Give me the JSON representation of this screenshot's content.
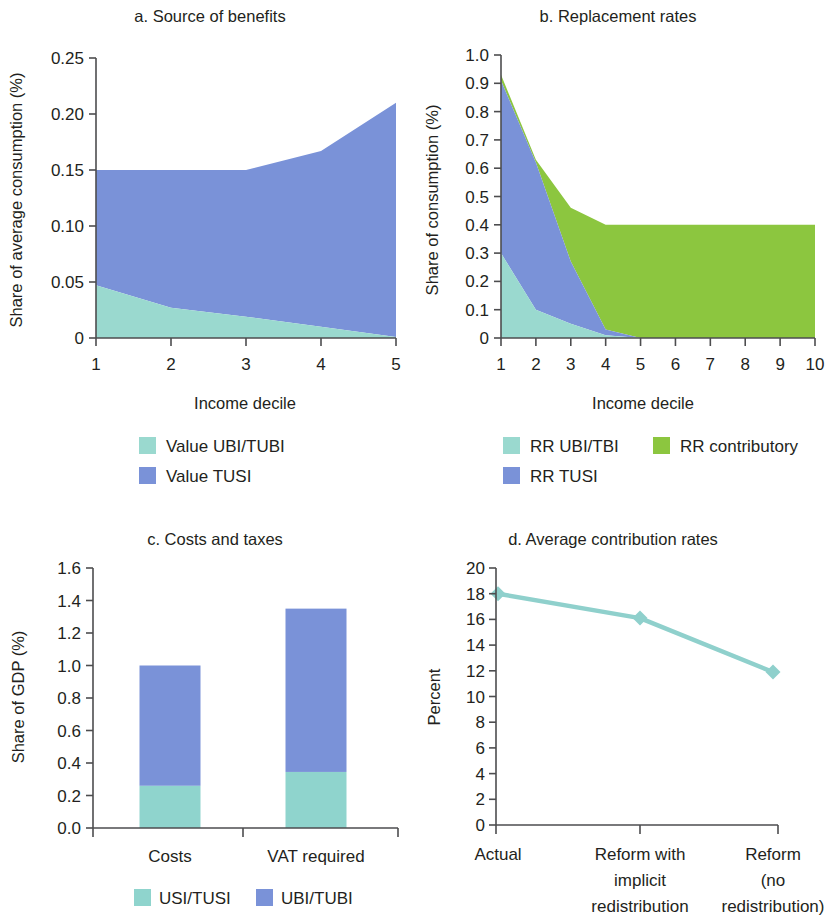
{
  "figure": {
    "background": "#ffffff",
    "axis_color": "#4d4d4f",
    "text_color": "#231f20"
  },
  "colors": {
    "teal_light": "#8fd4cd",
    "teal_area": "#7ec7a8",
    "teal_legend": "#9ad9cf",
    "blue": "#7a92d8",
    "green": "#8cc63f",
    "line_teal": "#8fd0cc"
  },
  "panels": {
    "a": {
      "title": "a. Source of benefits",
      "ylabel": "Share of average consumption (%)",
      "xlabel": "Income decile",
      "yticks": [
        "0",
        "0.05",
        "0.10",
        "0.15",
        "0.20",
        "0.25"
      ],
      "xticks": [
        "1",
        "2",
        "3",
        "4",
        "5"
      ],
      "legend": [
        {
          "label": "Value UBI/TUBI",
          "color": "#9ad9cf"
        },
        {
          "label": "Value TUSI",
          "color": "#7a92d8"
        }
      ]
    },
    "b": {
      "title": "b. Replacement rates",
      "ylabel": "Share of consumption (%)",
      "xlabel": "Income decile",
      "yticks": [
        "0",
        "0.1",
        "0.2",
        "0.3",
        "0.4",
        "0.5",
        "0.6",
        "0.7",
        "0.8",
        "0.9",
        "1.0"
      ],
      "xticks": [
        "1",
        "2",
        "3",
        "4",
        "5",
        "6",
        "7",
        "8",
        "9",
        "10"
      ],
      "legend": [
        {
          "label": "RR UBI/TBI",
          "color": "#9ad9cf"
        },
        {
          "label": "RR contributory",
          "color": "#8cc63f"
        },
        {
          "label": "RR TUSI",
          "color": "#7a92d8"
        }
      ]
    },
    "c": {
      "title": "c. Costs and taxes",
      "ylabel": "Share of GDP (%)",
      "yticks": [
        "0.0",
        "0.2",
        "0.4",
        "0.6",
        "0.8",
        "1.0",
        "1.2",
        "1.4",
        "1.6"
      ],
      "xticks": [
        "Costs",
        "VAT required"
      ],
      "legend": [
        {
          "label": "USI/TUSI",
          "color": "#8fd4cd"
        },
        {
          "label": "UBI/TUBI",
          "color": "#7a92d8"
        }
      ]
    },
    "d": {
      "title": "d. Average contribution rates",
      "ylabel": "Percent",
      "yticks": [
        "0",
        "2",
        "4",
        "6",
        "8",
        "10",
        "12",
        "14",
        "16",
        "18",
        "20"
      ],
      "xticks": [
        [
          "Actual"
        ],
        [
          "Reform with",
          "implicit",
          "redistribution"
        ],
        [
          "Reform",
          "(no",
          "redistribution)"
        ]
      ]
    }
  },
  "chart_data": [
    {
      "id": "a",
      "type": "area",
      "title": "a. Source of benefits",
      "xlabel": "Income decile",
      "ylabel": "Share of average consumption (%)",
      "x": [
        1,
        2,
        3,
        4,
        5
      ],
      "xlim": [
        1,
        5
      ],
      "ylim": [
        0,
        0.25
      ],
      "stacked": true,
      "grid": false,
      "legend_position": "bottom",
      "series": [
        {
          "name": "Value UBI/TUBI",
          "color": "#9ad9cf",
          "values": [
            0.047,
            0.027,
            0.019,
            0.01,
            0.001
          ]
        },
        {
          "name": "Value TUSI",
          "color": "#7a92d8",
          "values": [
            0.103,
            0.123,
            0.131,
            0.157,
            0.209
          ]
        }
      ],
      "totals": [
        0.15,
        0.15,
        0.15,
        0.167,
        0.21
      ]
    },
    {
      "id": "b",
      "type": "area",
      "title": "b. Replacement rates",
      "xlabel": "Income decile",
      "ylabel": "Share of consumption (%)",
      "x": [
        1,
        2,
        3,
        4,
        5,
        6,
        7,
        8,
        9,
        10
      ],
      "xlim": [
        1,
        10
      ],
      "ylim": [
        0,
        1.0
      ],
      "stacked": true,
      "grid": false,
      "legend_position": "bottom",
      "series": [
        {
          "name": "RR UBI/TBI",
          "color": "#9ad9cf",
          "values": [
            0.3,
            0.1,
            0.05,
            0.01,
            0.0,
            0.0,
            0.0,
            0.0,
            0.0,
            0.0
          ]
        },
        {
          "name": "RR TUSI",
          "color": "#7a92d8",
          "values": [
            0.61,
            0.52,
            0.22,
            0.02,
            0.0,
            0.0,
            0.0,
            0.0,
            0.0,
            0.0
          ]
        },
        {
          "name": "RR contributory",
          "color": "#8cc63f",
          "values": [
            0.02,
            0.01,
            0.19,
            0.37,
            0.4,
            0.4,
            0.4,
            0.4,
            0.4,
            0.4
          ]
        }
      ],
      "totals": [
        0.93,
        0.63,
        0.46,
        0.4,
        0.4,
        0.4,
        0.4,
        0.4,
        0.4,
        0.4
      ]
    },
    {
      "id": "c",
      "type": "bar",
      "title": "c. Costs and taxes",
      "xlabel": "",
      "ylabel": "Share of GDP (%)",
      "categories": [
        "Costs",
        "VAT required"
      ],
      "ylim": [
        0,
        1.6
      ],
      "stacked": true,
      "grid": false,
      "legend_position": "bottom",
      "series": [
        {
          "name": "USI/TUSI",
          "color": "#8fd4cd",
          "values": [
            0.26,
            0.345
          ]
        },
        {
          "name": "UBI/TUBI",
          "color": "#7a92d8",
          "values": [
            0.74,
            1.005
          ]
        }
      ],
      "totals": [
        1.0,
        1.35
      ]
    },
    {
      "id": "d",
      "type": "line",
      "title": "d. Average contribution rates",
      "xlabel": "",
      "ylabel": "Percent",
      "categories": [
        "Actual",
        "Reform with implicit redistribution",
        "Reform (no redistribution)"
      ],
      "ylim": [
        0,
        20
      ],
      "grid": false,
      "marker": "diamond",
      "series": [
        {
          "name": "Percent",
          "color": "#8fd0cc",
          "values": [
            18.0,
            16.1,
            11.9
          ]
        }
      ]
    }
  ]
}
